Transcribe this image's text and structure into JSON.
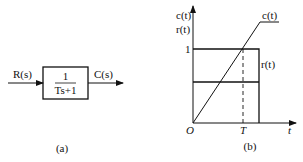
{
  "diagram_a": {
    "input_label": "R(s)",
    "output_label": "C(s)",
    "transfer_numerator": "1",
    "transfer_denominator": "Ts+1",
    "caption": "(a)"
  },
  "diagram_b": {
    "y_label_top": "c(t)",
    "y_label_bottom": "r(t)",
    "y_tick": "1",
    "x_tick": "T",
    "origin_label": "O",
    "x_axis_label": "t",
    "curve_c_label": "c(t)",
    "curve_r_label": "r(t)",
    "caption": "(b)"
  },
  "colors": {
    "stroke": "#111111",
    "background": "#ffffff"
  }
}
